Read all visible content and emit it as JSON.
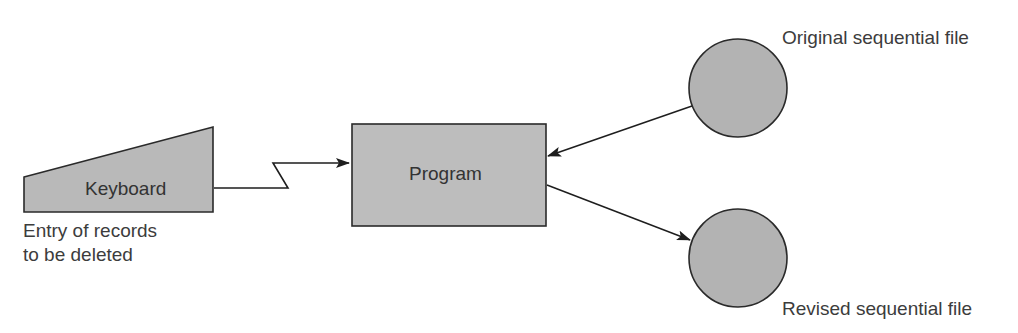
{
  "diagram": {
    "type": "flowchart",
    "colors": {
      "fill": "#b9b9b9",
      "stroke": "#2a2a2a",
      "background": "#ffffff"
    },
    "nodes": {
      "keyboard": {
        "label": "Keyboard",
        "shape": "manual-input-trapezoid",
        "caption_line1": "Entry of records",
        "caption_line2": "to be deleted"
      },
      "program": {
        "label": "Program",
        "shape": "rectangle"
      },
      "original_file": {
        "label": "Original sequential file",
        "shape": "circle"
      },
      "revised_file": {
        "label": "Revised sequential file",
        "shape": "circle"
      }
    },
    "edges": [
      {
        "from": "keyboard",
        "to": "program",
        "style": "lightning-link"
      },
      {
        "from": "original_file",
        "to": "program",
        "style": "arrow"
      },
      {
        "from": "program",
        "to": "revised_file",
        "style": "arrow"
      }
    ]
  }
}
